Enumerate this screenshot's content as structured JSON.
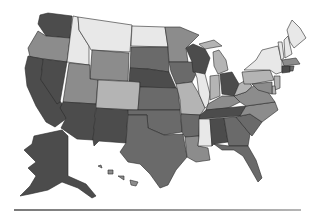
{
  "map": {
    "title": "United States choropleth (grayscale)",
    "shade_levels": {
      "1": "#e8e8e8",
      "2": "#b4b4b4",
      "3": "#8c8c8c",
      "4": "#6a6a6a",
      "5": "#4c4c4c"
    },
    "states": [
      {
        "id": "WA",
        "shade": 5
      },
      {
        "id": "OR",
        "shade": 3
      },
      {
        "id": "CA",
        "shade": 5
      },
      {
        "id": "NV",
        "shade": 5
      },
      {
        "id": "ID",
        "shade": 1
      },
      {
        "id": "MT",
        "shade": 1
      },
      {
        "id": "WY",
        "shade": 3
      },
      {
        "id": "UT",
        "shade": 3
      },
      {
        "id": "AZ",
        "shade": 5
      },
      {
        "id": "CO",
        "shade": 2
      },
      {
        "id": "NM",
        "shade": 5
      },
      {
        "id": "ND",
        "shade": 1
      },
      {
        "id": "SD",
        "shade": 4
      },
      {
        "id": "NE",
        "shade": 5
      },
      {
        "id": "KS",
        "shade": 4
      },
      {
        "id": "OK",
        "shade": 4
      },
      {
        "id": "TX",
        "shade": 4
      },
      {
        "id": "MN",
        "shade": 3
      },
      {
        "id": "IA",
        "shade": 4
      },
      {
        "id": "MO",
        "shade": 2
      },
      {
        "id": "AR",
        "shade": 4
      },
      {
        "id": "LA",
        "shade": 3
      },
      {
        "id": "WI",
        "shade": 5
      },
      {
        "id": "IL",
        "shade": 1
      },
      {
        "id": "MI",
        "shade": 2
      },
      {
        "id": "IN",
        "shade": 2
      },
      {
        "id": "OH",
        "shade": 5
      },
      {
        "id": "KY",
        "shade": 3
      },
      {
        "id": "TN",
        "shade": 5
      },
      {
        "id": "MS",
        "shade": 1
      },
      {
        "id": "AL",
        "shade": 5
      },
      {
        "id": "GA",
        "shade": 4
      },
      {
        "id": "FL",
        "shade": 4
      },
      {
        "id": "SC",
        "shade": 4
      },
      {
        "id": "NC",
        "shade": 3
      },
      {
        "id": "VA",
        "shade": 3
      },
      {
        "id": "WV",
        "shade": 2
      },
      {
        "id": "PA",
        "shade": 2
      },
      {
        "id": "NY",
        "shade": 1
      },
      {
        "id": "VT",
        "shade": 1
      },
      {
        "id": "NH",
        "shade": 1
      },
      {
        "id": "ME",
        "shade": 1
      },
      {
        "id": "MA",
        "shade": 3
      },
      {
        "id": "CT",
        "shade": 5
      },
      {
        "id": "RI",
        "shade": 4
      },
      {
        "id": "NJ",
        "shade": 2
      },
      {
        "id": "DE",
        "shade": 2
      },
      {
        "id": "MD",
        "shade": 3
      },
      {
        "id": "AK",
        "shade": 5
      },
      {
        "id": "HI",
        "shade": 3
      }
    ]
  }
}
